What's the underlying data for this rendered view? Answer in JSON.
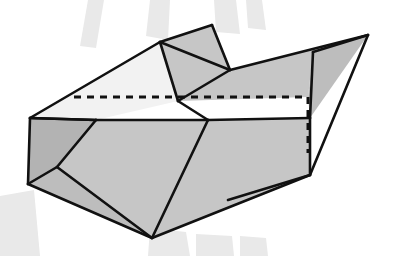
{
  "page": {
    "width": 395,
    "height": 256,
    "background_color": "#ffffff"
  },
  "palette": {
    "outline": "#111111",
    "face_light": "#f2f2f2",
    "face_mid": "#c6c6c6",
    "face_mid_dark": "#bdbdbd",
    "face_shadow": "#b3b3b3",
    "hidden_edge": "#111111",
    "watermark": "#e9e9e9",
    "background": "#ffffff"
  },
  "stroke": {
    "outer_width": 3.2,
    "inner_width": 2.6,
    "dash_width": 3.0,
    "dash_pattern": "7 6"
  },
  "watermark": {
    "label": "faint-scan-shadow",
    "bands": [
      {
        "name": "band-top-left",
        "points": "88,0 104,0 96,48 80,46"
      },
      {
        "name": "band-top-mid",
        "points": "150,0 170,0 168,40 146,36"
      },
      {
        "name": "band-top-right",
        "points": "214,0 236,0 240,34 216,32"
      },
      {
        "name": "band-top-far",
        "points": "246,0 262,0 266,30 248,28"
      },
      {
        "name": "band-bottom-left",
        "points": "0,196 34,190 40,256 0,256"
      },
      {
        "name": "band-bottom-mid",
        "points": "150,228 186,232 190,256 148,256"
      },
      {
        "name": "band-bottom-right",
        "points": "196,234 232,236 234,256 196,256"
      },
      {
        "name": "band-bottom-far",
        "points": "240,236 266,238 268,256 240,256"
      }
    ]
  },
  "solid": {
    "name": "shaded-polyhedron",
    "vertices": {
      "left_top": [
        30,
        118
      ],
      "left_bottom": [
        28,
        184
      ],
      "ridge_left": [
        160,
        42
      ],
      "apex": [
        212,
        25
      ],
      "ridge_right": [
        230,
        70
      ],
      "front_notch": [
        178,
        101
      ],
      "right_tip": [
        368,
        35
      ],
      "right_upper": [
        313,
        52
      ],
      "right_corner": [
        310,
        118
      ],
      "right_dash_top": [
        308,
        97
      ],
      "right_low": [
        308,
        175
      ],
      "bottom_vertex": [
        152,
        238
      ],
      "inner_left": [
        57,
        167
      ],
      "mid_front": [
        208,
        120
      ],
      "left_face_tip": [
        96,
        120
      ],
      "dash_left": [
        74,
        97
      ],
      "dash_right": [
        308,
        97
      ]
    },
    "faces": [
      {
        "name": "face-top-light-large",
        "fill": "face_light",
        "points": "30,118 160,42 178,101 96,120"
      },
      {
        "name": "face-top-light-wing",
        "fill": "face_light",
        "points": "160,42 212,25 230,70 178,101"
      },
      {
        "name": "face-upper-parallelogram",
        "fill": "face_mid",
        "points": "160,42 212,25 230,70 178,101"
      },
      {
        "name": "face-right-long-slope",
        "fill": "face_mid",
        "points": "230,70 368,35 313,52 308,97 178,101"
      },
      {
        "name": "face-right-tip-wedge",
        "fill": "face_mid_dark",
        "points": "313,52 368,35 310,118 308,97"
      },
      {
        "name": "face-front-large",
        "fill": "face_mid",
        "points": "30,118 96,120 208,120 310,118 310,175 152,238 28,184"
      },
      {
        "name": "face-left-small",
        "fill": "face_shadow",
        "points": "30,118 96,120 57,167 28,184"
      },
      {
        "name": "face-bottom-strip",
        "fill": "face_mid_dark",
        "points": "28,184 57,167 152,238"
      }
    ],
    "solid_edges": [
      {
        "name": "edge-left-slope-up",
        "from": [
          30,
          118
        ],
        "to": [
          160,
          42
        ]
      },
      {
        "name": "edge-ridge-to-apex",
        "from": [
          160,
          42
        ],
        "to": [
          212,
          25
        ]
      },
      {
        "name": "edge-apex-to-ridgeright",
        "from": [
          212,
          25
        ],
        "to": [
          230,
          70
        ]
      },
      {
        "name": "edge-ridge-diagonal",
        "from": [
          160,
          42
        ],
        "to": [
          230,
          70
        ]
      },
      {
        "name": "edge-ridgeleft-down",
        "from": [
          160,
          42
        ],
        "to": [
          178,
          101
        ]
      },
      {
        "name": "edge-ridgeright-down",
        "from": [
          230,
          70
        ],
        "to": [
          178,
          101
        ]
      },
      {
        "name": "edge-notch-to-front",
        "from": [
          178,
          101
        ],
        "to": [
          208,
          120
        ]
      },
      {
        "name": "edge-ridgeright-to-tip",
        "from": [
          230,
          70
        ],
        "to": [
          368,
          35
        ]
      },
      {
        "name": "edge-tip-to-upper",
        "from": [
          368,
          35
        ],
        "to": [
          313,
          52
        ]
      },
      {
        "name": "edge-upper-to-corner",
        "from": [
          313,
          52
        ],
        "to": [
          310,
          118
        ]
      },
      {
        "name": "edge-tip-to-low",
        "from": [
          368,
          35
        ],
        "to": [
          310,
          175
        ]
      },
      {
        "name": "edge-corner-to-low",
        "from": [
          310,
          118
        ],
        "to": [
          310,
          175
        ]
      },
      {
        "name": "edge-front-top-left",
        "from": [
          30,
          118
        ],
        "to": [
          96,
          120
        ]
      },
      {
        "name": "edge-front-top-mid",
        "from": [
          96,
          120
        ],
        "to": [
          208,
          120
        ]
      },
      {
        "name": "edge-front-top-right",
        "from": [
          208,
          120
        ],
        "to": [
          310,
          118
        ]
      },
      {
        "name": "edge-left-vertical",
        "from": [
          30,
          118
        ],
        "to": [
          28,
          184
        ]
      },
      {
        "name": "edge-bottom-left-down",
        "from": [
          28,
          184
        ],
        "to": [
          152,
          238
        ]
      },
      {
        "name": "edge-bottom-right-up",
        "from": [
          152,
          238
        ],
        "to": [
          310,
          175
        ]
      },
      {
        "name": "edge-inner-left-a",
        "from": [
          96,
          120
        ],
        "to": [
          57,
          167
        ]
      },
      {
        "name": "edge-inner-left-b",
        "from": [
          57,
          167
        ],
        "to": [
          28,
          184
        ]
      },
      {
        "name": "edge-inner-left-c",
        "from": [
          57,
          167
        ],
        "to": [
          152,
          238
        ]
      },
      {
        "name": "edge-inner-front-diag",
        "from": [
          208,
          120
        ],
        "to": [
          152,
          238
        ]
      },
      {
        "name": "edge-inner-right-diag",
        "from": [
          310,
          175
        ],
        "to": [
          228,
          200
        ]
      },
      {
        "name": "edge-leftface-seam",
        "from": [
          96,
          120
        ],
        "to": [
          30,
          118
        ]
      }
    ],
    "hidden_edges": [
      {
        "name": "hidden-edge-horizontal-back-ridge",
        "from": [
          74,
          97
        ],
        "to": [
          308,
          97
        ]
      },
      {
        "name": "hidden-edge-vertical-back-right",
        "from": [
          308,
          97
        ],
        "to": [
          308,
          153
        ]
      }
    ]
  }
}
